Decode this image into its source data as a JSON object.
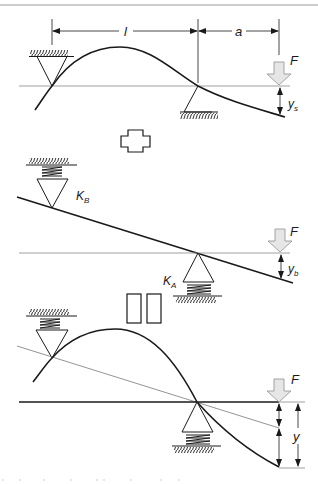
{
  "figure": {
    "type": "beam superposition diagram",
    "panels": [
      {
        "id": "rigid-supports",
        "dimension_labels": [
          "l",
          "a"
        ],
        "load_label": "F",
        "deflection_label": {
          "main": "y",
          "sub": "s"
        }
      },
      {
        "id": "spring-supports",
        "spring_labels": [
          {
            "main": "K",
            "sub": "B"
          },
          {
            "main": "K",
            "sub": "A"
          }
        ],
        "load_label": "F",
        "deflection_label": {
          "main": "y",
          "sub": "b"
        }
      },
      {
        "id": "combined",
        "load_label": "F",
        "deflection_label": "y"
      }
    ],
    "operators": [
      "plus",
      "equals"
    ],
    "colors": {
      "line": "#1a1a1a",
      "thin_line": "#888888",
      "load_arrow_fill": "#e6e6e6",
      "load_arrow_stroke": "#9a9a9a",
      "rule": "#9a9a9a"
    }
  }
}
